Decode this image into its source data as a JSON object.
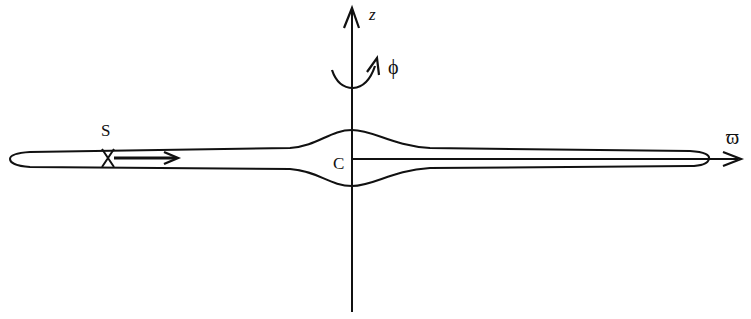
{
  "diagram": {
    "labels": {
      "z_axis": "z",
      "azimuth": "ϕ",
      "source": "S",
      "center": "C",
      "radial_axis": "ϖ"
    },
    "colors": {
      "stroke": "#111111",
      "background": "#ffffff"
    }
  }
}
